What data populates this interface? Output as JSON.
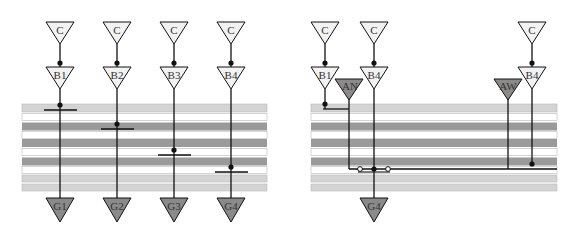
{
  "colors": {
    "band_light": "#d4d4d4",
    "band_dark": "#9a9a9a",
    "band_white": "#ffffff",
    "band_stroke": "#b8b8b8",
    "tri_light_fill": "#f2f2f2",
    "tri_dark_fill": "#8a8a8a",
    "line": "#111111"
  },
  "left_panel": {
    "columns": [
      {
        "top_label": "C",
        "buffer_label": "B1",
        "gate_label": "G1"
      },
      {
        "top_label": "C",
        "buffer_label": "B2",
        "gate_label": "G2"
      },
      {
        "top_label": "C",
        "buffer_label": "B3",
        "gate_label": "G3"
      },
      {
        "top_label": "C",
        "buffer_label": "B4",
        "gate_label": "G4"
      }
    ]
  },
  "right_panel": {
    "clock_labels": [
      "C",
      "C",
      "C"
    ],
    "buffer_labels": [
      "B1",
      "B4",
      "B4"
    ],
    "arbiter_labels": [
      "AN",
      "AW"
    ],
    "gate_label": "G4"
  }
}
